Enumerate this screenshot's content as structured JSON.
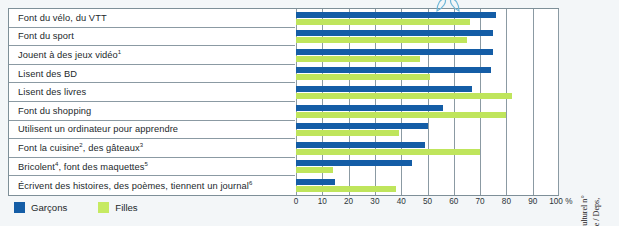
{
  "chart_data": {
    "type": "bar",
    "orientation": "horizontal",
    "title": "",
    "xlabel": "",
    "ylabel": "",
    "xlim": [
      0,
      100
    ],
    "grid": true,
    "legend_position": "bottom-left",
    "tick_labels": [
      "0",
      "10",
      "20",
      "30",
      "40",
      "50",
      "60",
      "70",
      "80",
      "90",
      "100 %"
    ],
    "tick_values": [
      0,
      10,
      20,
      30,
      40,
      50,
      60,
      70,
      80,
      90,
      100
    ],
    "categories": [
      "Font du vélo, du VTT",
      "Font du sport",
      "Jouent à des jeux vidéo¹",
      "Lisent des BD",
      "Lisent des livres",
      "Font du shopping",
      "Utilisent un ordinateur pour apprendre",
      "Font la cuisine², des gâteaux³",
      "Bricolent⁴, font des maquettes⁵",
      "Écrivent des histoires, des poèmes, tiennent un journal⁶"
    ],
    "series": [
      {
        "name": "Garçons",
        "color": "#145da6",
        "values": [
          76,
          75,
          75,
          74,
          67,
          56,
          50,
          49,
          44,
          15
        ]
      },
      {
        "name": "Filles",
        "color": "#bfe55c",
        "values": [
          66,
          65,
          47,
          51,
          82,
          80,
          39,
          70,
          14,
          38
        ]
      }
    ]
  },
  "rows": [
    {
      "label_main": "Font du vélo, du VTT",
      "sup": ""
    },
    {
      "label_main": "Font du sport",
      "sup": ""
    },
    {
      "label_main": "Jouent à des jeux vidéo",
      "sup": "1"
    },
    {
      "label_main": "Lisent des BD",
      "sup": ""
    },
    {
      "label_main": "Lisent des livres",
      "sup": ""
    },
    {
      "label_main": "Font du shopping",
      "sup": ""
    },
    {
      "label_main": "Utilisent un ordinateur pour apprendre",
      "sup": ""
    },
    {
      "label_main": "Font la cuisine",
      "sup": "2",
      "label_mid": ", des gâteaux",
      "sup2": "3"
    },
    {
      "label_main": "Bricolent",
      "sup": "4",
      "label_mid": ", font des maquettes",
      "sup2": "5"
    },
    {
      "label_main": "Écrivent des histoires, des poèmes, tiennent un journal",
      "sup": "6"
    }
  ],
  "legend": {
    "boys_label": "Garçons",
    "girls_label": "Filles",
    "boys_color": "#145da6",
    "girls_color": "#c6ea62"
  },
  "source": {
    "text": "© Les loisirs des 8–19 ans, Développement Culturel n° 131 de décembre 1999 (Ministère de la culture / Deps, France)"
  }
}
